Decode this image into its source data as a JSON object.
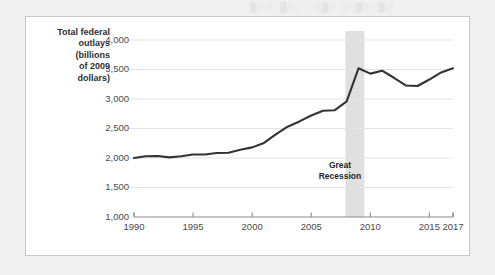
{
  "page": {
    "ghost_text": "█░▒░█▒░ ░▒█░ ▒░█▒░█▒"
  },
  "chart_data": {
    "type": "line",
    "title": "",
    "xlabel": "",
    "ylabel": "Total federal outlays (billions of 2009 dollars)",
    "ylabel_lines": [
      "Total federal",
      "outlays",
      "(billions",
      "of 2009",
      "dollars)"
    ],
    "xlim": [
      1990,
      2017
    ],
    "ylim": [
      1000,
      4000
    ],
    "ytick_values": [
      1000,
      1500,
      2000,
      2500,
      3000,
      3500,
      4000
    ],
    "ytick_labels": [
      "1,000",
      "1,500",
      "2,000",
      "2,500",
      "3,000",
      "3,500",
      "4,000"
    ],
    "xtick_values": [
      1990,
      1995,
      2000,
      2005,
      2010,
      2015,
      2017
    ],
    "xtick_labels": [
      "1990",
      "1995",
      "2000",
      "2005",
      "2010",
      "2015",
      "2017"
    ],
    "grid": "horizontal",
    "legend": "none",
    "line_color": "#333333",
    "grid_color": "#e3e3e3",
    "axis_color": "#8c8c8c",
    "annotations": [
      {
        "name": "great-recession-band",
        "label": "Great Recession",
        "label_lines": [
          "Great",
          "Recession"
        ],
        "x_start": 2007.9,
        "x_end": 2009.5,
        "band_color": "#e0e0e0"
      }
    ],
    "x": [
      1990,
      1991,
      1992,
      1993,
      1994,
      1995,
      1996,
      1997,
      1998,
      1999,
      2000,
      2001,
      2002,
      2003,
      2004,
      2005,
      2006,
      2007,
      2008,
      2009,
      2010,
      2011,
      2012,
      2013,
      2014,
      2015,
      2016,
      2017
    ],
    "values": [
      2000,
      2030,
      2035,
      2010,
      2030,
      2060,
      2060,
      2085,
      2090,
      2140,
      2180,
      2255,
      2400,
      2530,
      2620,
      2720,
      2800,
      2810,
      2960,
      3520,
      3430,
      3480,
      3360,
      3230,
      3220,
      3330,
      3450,
      3520
    ],
    "series": [
      {
        "name": "Total federal outlays",
        "values": [
          2000,
          2030,
          2035,
          2010,
          2030,
          2060,
          2060,
          2085,
          2090,
          2140,
          2180,
          2255,
          2400,
          2530,
          2620,
          2720,
          2800,
          2810,
          2960,
          3520,
          3430,
          3480,
          3360,
          3230,
          3220,
          3330,
          3450,
          3520
        ]
      }
    ]
  }
}
